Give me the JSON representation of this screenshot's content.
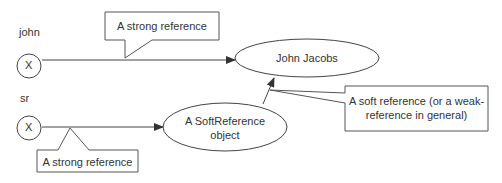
{
  "diagram": {
    "variables": [
      {
        "name": "john",
        "symbol": "X"
      },
      {
        "name": "sr",
        "symbol": "X"
      }
    ],
    "objects": [
      {
        "id": "john_jacobs",
        "label": "John Jacobs"
      },
      {
        "id": "soft_ref",
        "label_line1": "A SoftReference",
        "label_line2": "object"
      }
    ],
    "callouts": {
      "top_strong": "A strong reference",
      "bottom_strong": "A strong reference",
      "soft_line1": "A soft reference (or a weak-",
      "soft_line2": "reference in general)"
    },
    "edges": [
      {
        "from": "john",
        "to": "John Jacobs",
        "type": "strong"
      },
      {
        "from": "sr",
        "to": "A SoftReference object",
        "type": "strong"
      },
      {
        "from": "A SoftReference object",
        "to": "John Jacobs",
        "type": "soft"
      }
    ],
    "colors": {
      "stroke": "#333333",
      "text": "#333333",
      "background": "#ffffff"
    }
  }
}
